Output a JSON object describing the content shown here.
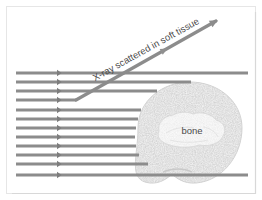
{
  "figure": {
    "name": "x-ray-scattering-diagram",
    "background_color": "#ffffff",
    "frame_color": "#e8e8e8",
    "beam_color": "#8c8c8c",
    "tissue_fill": "#f2f2f2",
    "tissue_stroke": "#cfcfcf",
    "bone_fill": "#fafafa",
    "bone_stroke": "#d2d2d2",
    "text_color": "#4a4a4a"
  },
  "labels": {
    "scatter_label": "X-ray scattered in soft tissue",
    "bone_label": "bone"
  },
  "beams": {
    "count": 12,
    "left_x": 16,
    "arrow_x": 57,
    "rows": [
      {
        "y": 73,
        "end_x": 248,
        "kind": "full"
      },
      {
        "y": 82,
        "end_x": 191,
        "kind": "to-tissue"
      },
      {
        "y": 91,
        "end_x": 157,
        "kind": "to-tissue"
      },
      {
        "y": 100,
        "end_x": 76,
        "kind": "scattered"
      },
      {
        "y": 110,
        "end_x": 141,
        "kind": "to-tissue"
      },
      {
        "y": 119,
        "end_x": 138,
        "kind": "to-tissue"
      },
      {
        "y": 128,
        "end_x": 136,
        "kind": "to-tissue"
      },
      {
        "y": 137,
        "end_x": 135,
        "kind": "to-tissue"
      },
      {
        "y": 146,
        "end_x": 136,
        "kind": "to-tissue"
      },
      {
        "y": 155,
        "end_x": 139,
        "kind": "to-tissue"
      },
      {
        "y": 164,
        "end_x": 148,
        "kind": "to-tissue"
      },
      {
        "y": 175,
        "end_x": 248,
        "kind": "full"
      }
    ]
  },
  "scattered_ray": {
    "origin_x": 76,
    "origin_y": 100,
    "tip_x": 216,
    "tip_y": 21,
    "label_angle_deg": -29
  },
  "tissue": {
    "center_x": 190,
    "center_y": 133,
    "radius_x": 52,
    "radius_y": 51
  },
  "bone": {
    "center_x": 192,
    "center_y": 131,
    "radius_x": 33,
    "radius_y": 15
  }
}
